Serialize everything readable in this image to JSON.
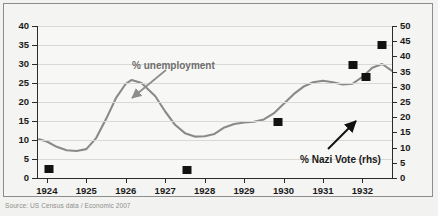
{
  "figure": {
    "source_note": "Source: US Census data / Economic 2007",
    "background_color": "#f2f2f0",
    "line_color": "#8a8a8a",
    "marker_color": "#121212"
  },
  "annotations": [
    {
      "name": "unemployment-label",
      "text": "% unemployment",
      "x": 128,
      "y": 56
    },
    {
      "name": "nazi-vote-label",
      "text": "% Nazi Vote (rhs)",
      "x": 296,
      "y": 150
    }
  ],
  "chart_data": {
    "type": "line",
    "title": "",
    "subtitle": "",
    "xlabel": "",
    "ylabel": "% unemployment",
    "y2label": "% Nazi Vote (rhs)",
    "xlim": [
      1923.75,
      1932.75
    ],
    "ylim": [
      0,
      40
    ],
    "y2lim": [
      0,
      50
    ],
    "grid": true,
    "legend": "annotations",
    "xticks": [
      "1924",
      "1925",
      "1926",
      "1927",
      "1928",
      "1929",
      "1930",
      "1931",
      "1932"
    ],
    "xtick_values": [
      1924,
      1925,
      1926,
      1927,
      1928,
      1929,
      1930,
      1931,
      1932
    ],
    "yticks_left": [
      0,
      5,
      10,
      15,
      20,
      25,
      30,
      35,
      40
    ],
    "yticks_right": [
      0,
      5,
      10,
      15,
      20,
      25,
      30,
      35,
      40,
      45,
      50
    ],
    "series": [
      {
        "name": "% unemployment",
        "axis": "left",
        "type": "line",
        "color": "#8a8a8a",
        "x": [
          1923.8,
          1924.0,
          1924.25,
          1924.5,
          1924.75,
          1925.0,
          1925.25,
          1925.5,
          1925.75,
          1926.0,
          1926.15,
          1926.4,
          1926.75,
          1927.0,
          1927.25,
          1927.5,
          1927.75,
          1928.0,
          1928.25,
          1928.5,
          1928.75,
          1929.0,
          1929.25,
          1929.5,
          1929.75,
          1930.0,
          1930.25,
          1930.5,
          1930.75,
          1931.0,
          1931.25,
          1931.5,
          1931.75,
          1932.0,
          1932.25,
          1932.5,
          1932.75
        ],
        "y": [
          10.2,
          9.6,
          8.2,
          7.3,
          7.1,
          7.6,
          10.5,
          15.5,
          21.0,
          24.8,
          25.8,
          25.0,
          21.5,
          17.5,
          14.0,
          11.8,
          10.9,
          11.0,
          11.6,
          13.3,
          14.2,
          14.6,
          14.8,
          15.4,
          17.0,
          19.5,
          22.0,
          24.0,
          25.2,
          25.6,
          25.2,
          24.6,
          24.8,
          26.6,
          29.0,
          30.0,
          28.2
        ]
      },
      {
        "name": "% Nazi Vote (rhs)",
        "axis": "right",
        "type": "scatter",
        "color": "#121212",
        "points": [
          {
            "x": 1924.05,
            "y": 3.0
          },
          {
            "x": 1927.55,
            "y": 2.6
          },
          {
            "x": 1929.85,
            "y": 18.3
          },
          {
            "x": 1931.75,
            "y": 37.3
          },
          {
            "x": 1932.1,
            "y": 33.1
          },
          {
            "x": 1932.5,
            "y": 43.9
          }
        ]
      }
    ]
  }
}
